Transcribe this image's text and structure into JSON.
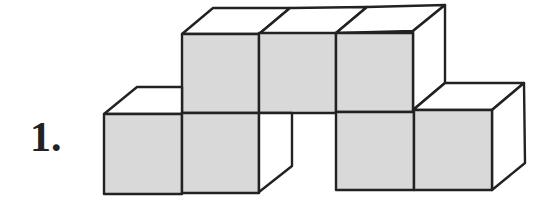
{
  "figure": {
    "label": "1.",
    "colors": {
      "front_face": "#d9d9d9",
      "top_side_face": "#ffffff",
      "stroke": "#222222",
      "background": "#ffffff"
    },
    "cube_count": 7,
    "rows": {
      "top": {
        "count": 3
      },
      "bottom": {
        "count": 4,
        "gap_position": 3
      }
    }
  }
}
